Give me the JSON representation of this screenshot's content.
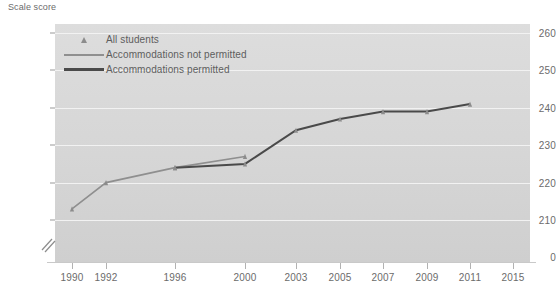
{
  "axis_title": "Scale score",
  "legend": {
    "items": [
      {
        "label": "All students",
        "key": "triangle-marker",
        "color": "#8c8c8c"
      },
      {
        "label": "Accommodations not permitted",
        "key": "line-swatch",
        "color": "#8f8f8f"
      },
      {
        "label": "Accommodations permitted",
        "key": "line-swatch",
        "color": "#4a4a4a"
      }
    ]
  },
  "chart_data": {
    "type": "line",
    "title": "",
    "xlabel": "",
    "ylabel": "Scale score",
    "x": [
      1990,
      1992,
      1996,
      2000,
      2003,
      2005,
      2007,
      2009,
      2011,
      2015
    ],
    "xtick_labels": [
      "1990",
      "1992",
      "1996",
      "2000",
      "2003",
      "2005",
      "2007",
      "2009",
      "2011",
      "2015"
    ],
    "ytick_labels": [
      "0",
      "210",
      "220",
      "230",
      "240",
      "250",
      "260"
    ],
    "ylim": [
      200,
      260
    ],
    "yticks": [
      210,
      220,
      230,
      240,
      250,
      260
    ],
    "y_axis_break": true,
    "y_axis_break_label": "0",
    "grid": true,
    "legend_position": "top-left",
    "marker": "triangle",
    "series": [
      {
        "name": "Accommodations not permitted",
        "color": "#8f8f8f",
        "points": [
          {
            "x": 1990,
            "y": 213
          },
          {
            "x": 1992,
            "y": 220
          },
          {
            "x": 1996,
            "y": 224
          },
          {
            "x": 2000,
            "y": 227
          }
        ]
      },
      {
        "name": "Accommodations permitted",
        "color": "#4a4a4a",
        "points": [
          {
            "x": 1996,
            "y": 224
          },
          {
            "x": 2000,
            "y": 225
          },
          {
            "x": 2003,
            "y": 234
          },
          {
            "x": 2005,
            "y": 237
          },
          {
            "x": 2007,
            "y": 239
          },
          {
            "x": 2009,
            "y": 239
          },
          {
            "x": 2011,
            "y": 241
          }
        ]
      }
    ]
  },
  "colors": {
    "plot_background": "#d7d7d7",
    "gridline": "#f2f2f2",
    "text": "#6b6b6b",
    "marker": "#8c8c8c",
    "line_light": "#8f8f8f",
    "line_dark": "#4a4a4a"
  }
}
